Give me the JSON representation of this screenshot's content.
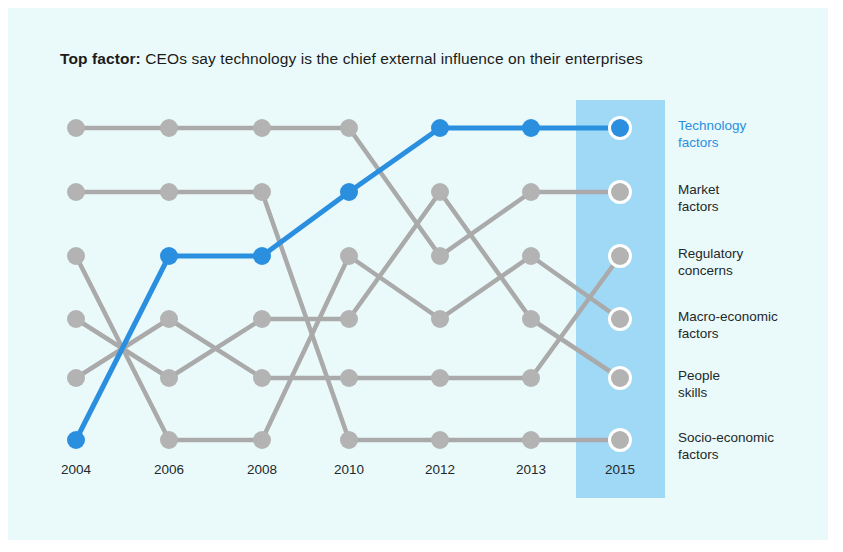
{
  "title": {
    "lead": "Top factor:",
    "rest": "CEOs say technology is the chief external influence on their enterprises"
  },
  "colors": {
    "panel_bg": "#eafafa",
    "highlight_band": "#9fd9f6",
    "accent": "#2b8fe0",
    "grey": "#aaaaaa",
    "dot_grey": "#b3b3b3",
    "text": "#23282b"
  },
  "highlight": {
    "year": "2015"
  },
  "chart_data": {
    "type": "line",
    "title": "Top factor: CEOs say technology is the chief external influence on their enterprises",
    "xlabel": "",
    "ylabel": "",
    "grid": false,
    "legend": "right-labels",
    "categories": [
      "2004",
      "2006",
      "2008",
      "2010",
      "2012",
      "2013",
      "2015"
    ],
    "ranks": [
      1,
      2,
      3,
      4,
      5,
      6
    ],
    "rank_labels": [
      "Technology\nfactors",
      "Market\nfactors",
      "Regulatory\nconcerns",
      "Macro-economic\nfactors",
      "People\nskills",
      "Socio-economic\nfactors"
    ],
    "series": [
      {
        "name": "Technology factors",
        "highlight": true,
        "values": [
          6,
          3,
          3,
          2,
          1,
          1,
          1
        ]
      },
      {
        "name": "Market factors",
        "highlight": false,
        "values": [
          1,
          1,
          1,
          1,
          3,
          2,
          2
        ]
      },
      {
        "name": "Regulatory concerns",
        "highlight": false,
        "values": [
          2,
          2,
          2,
          6,
          6,
          6,
          6
        ]
      },
      {
        "name": "Macro-economic factors",
        "highlight": false,
        "values": [
          3,
          6,
          6,
          3,
          4,
          3,
          4
        ]
      },
      {
        "name": "People skills",
        "highlight": false,
        "values": [
          5,
          4,
          5,
          5,
          5,
          5,
          3
        ]
      },
      {
        "name": "Socio-economic factors",
        "highlight": false,
        "values": [
          4,
          5,
          4,
          4,
          2,
          4,
          5
        ]
      }
    ]
  },
  "axis_labels": [
    "2004",
    "2006",
    "2008",
    "2010",
    "2012",
    "2013",
    "2015"
  ]
}
